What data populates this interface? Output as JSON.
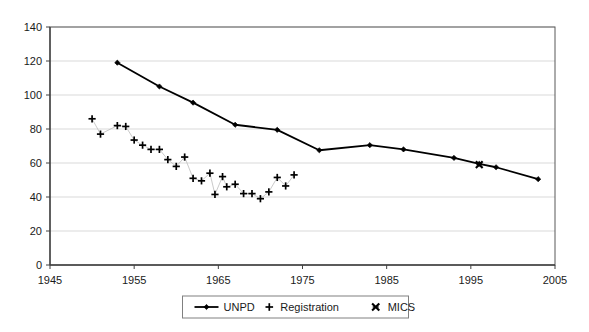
{
  "chart_data": {
    "type": "line",
    "title": "",
    "xlabel": "",
    "ylabel": "",
    "xlim": [
      1945,
      2005
    ],
    "ylim": [
      0,
      140
    ],
    "xticks": [
      1945,
      1955,
      1965,
      1975,
      1985,
      1995,
      2005
    ],
    "yticks": [
      0,
      20,
      40,
      60,
      80,
      100,
      120,
      140
    ],
    "grid": "horizontal",
    "legend_position": "bottom-center",
    "series": [
      {
        "name": "UNPD",
        "marker": "diamond",
        "line": true,
        "color": "#000000",
        "points": [
          {
            "x": 1953,
            "y": 119
          },
          {
            "x": 1958,
            "y": 105
          },
          {
            "x": 1962,
            "y": 95.5
          },
          {
            "x": 1967,
            "y": 82.5
          },
          {
            "x": 1972,
            "y": 79.5
          },
          {
            "x": 1977,
            "y": 67.5
          },
          {
            "x": 1983,
            "y": 70.5
          },
          {
            "x": 1987,
            "y": 68
          },
          {
            "x": 1993,
            "y": 63
          },
          {
            "x": 1996,
            "y": 59.5
          },
          {
            "x": 1998,
            "y": 57.5
          },
          {
            "x": 2003,
            "y": 50.5
          }
        ]
      },
      {
        "name": "Registration",
        "marker": "plus",
        "line": false,
        "color": "#000000",
        "points": [
          {
            "x": 1950,
            "y": 86
          },
          {
            "x": 1951,
            "y": 77
          },
          {
            "x": 1953,
            "y": 82
          },
          {
            "x": 1954,
            "y": 81.5
          },
          {
            "x": 1955,
            "y": 73.5
          },
          {
            "x": 1956,
            "y": 70.5
          },
          {
            "x": 1957,
            "y": 68
          },
          {
            "x": 1958,
            "y": 68
          },
          {
            "x": 1959,
            "y": 62
          },
          {
            "x": 1960,
            "y": 58
          },
          {
            "x": 1961,
            "y": 63.5
          },
          {
            "x": 1962,
            "y": 51
          },
          {
            "x": 1963,
            "y": 49.5
          },
          {
            "x": 1964,
            "y": 54
          },
          {
            "x": 1964.6,
            "y": 41.5
          },
          {
            "x": 1965.5,
            "y": 52
          },
          {
            "x": 1966,
            "y": 46
          },
          {
            "x": 1967,
            "y": 47.5
          },
          {
            "x": 1968,
            "y": 42
          },
          {
            "x": 1969,
            "y": 42
          },
          {
            "x": 1970,
            "y": 39
          },
          {
            "x": 1971,
            "y": 43
          },
          {
            "x": 1972,
            "y": 51.5
          },
          {
            "x": 1973,
            "y": 46.5
          },
          {
            "x": 1974,
            "y": 53
          }
        ]
      },
      {
        "name": "MICS",
        "marker": "cross",
        "line": false,
        "color": "#000000",
        "points": [
          {
            "x": 1996,
            "y": 59
          }
        ]
      }
    ]
  },
  "legend": {
    "items": [
      {
        "label": "UNPD",
        "marker": "line-diamond"
      },
      {
        "label": "Registration",
        "marker": "plus"
      },
      {
        "label": "MICS",
        "marker": "cross"
      }
    ]
  },
  "colors": {
    "axis": "#595959",
    "grid": "#d9d9d9",
    "series": "#000000",
    "background": "#ffffff"
  }
}
